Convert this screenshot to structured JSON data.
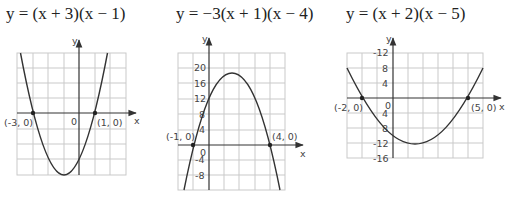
{
  "graphs": [
    {
      "title": "y = (x + 3)(x − 1)",
      "axis_x": "x",
      "axis_y": "y",
      "origin_label": "0",
      "root_labels": [
        "(-3, 0)",
        "(1, 0)"
      ],
      "y_ticks": []
    },
    {
      "title": "y = −3(x + 1)(x − 4)",
      "axis_x": "x",
      "axis_y": "y",
      "origin_label": "0",
      "root_labels": [
        "(-1, 0)",
        "(4, 0)"
      ],
      "y_ticks": [
        "20",
        "16",
        "12",
        "8",
        "4",
        "-4",
        "-8"
      ]
    },
    {
      "title": "y = (x + 2)(x − 5)",
      "axis_x": "x",
      "axis_y": "y",
      "origin_label": "0",
      "root_labels": [
        "(-2, 0)",
        "(5, 0)"
      ],
      "y_ticks": [
        "-12",
        "8",
        "4",
        "4",
        "8",
        "-12",
        "-16"
      ]
    }
  ],
  "chart_data": [
    {
      "type": "line",
      "title": "y = (x + 3)(x − 1)",
      "xlabel": "x",
      "ylabel": "y",
      "xlim": [
        -4,
        3
      ],
      "ylim": [
        -4,
        4
      ],
      "grid": true,
      "series": [
        {
          "name": "y = (x + 3)(x − 1)",
          "x": [
            -3.3,
            -3,
            -2,
            -1,
            0,
            1,
            2,
            2.3
          ],
          "y": [
            1.39,
            0,
            -3,
            -4,
            -3,
            0,
            5,
            4.29
          ]
        }
      ],
      "annotations": [
        {
          "label": "(-3, 0)",
          "x": -3,
          "y": 0
        },
        {
          "label": "(1, 0)",
          "x": 1,
          "y": 0
        }
      ],
      "vertex": [
        -1,
        -4
      ]
    },
    {
      "type": "line",
      "title": "y = −3(x + 1)(x − 4)",
      "xlabel": "x",
      "ylabel": "y",
      "xlim": [
        -2,
        5
      ],
      "ylim": [
        -12,
        24
      ],
      "y_ticks": [
        20,
        16,
        12,
        8,
        4,
        0,
        -4,
        -8
      ],
      "grid": true,
      "series": [
        {
          "name": "y = −3(x + 1)(x − 4)",
          "x": [
            -1.6,
            -1,
            0,
            1,
            1.5,
            2,
            3,
            4,
            4.6
          ],
          "y": [
            -11.5,
            0,
            12,
            18,
            18.75,
            18,
            12,
            0,
            -11.5
          ]
        }
      ],
      "annotations": [
        {
          "label": "(-1, 0)",
          "x": -1,
          "y": 0
        },
        {
          "label": "(4, 0)",
          "x": 4,
          "y": 0
        }
      ],
      "vertex": [
        1.5,
        18.75
      ]
    },
    {
      "type": "line",
      "title": "y = (x + 2)(x − 5)",
      "xlabel": "x",
      "ylabel": "y",
      "xlim": [
        -3,
        6
      ],
      "ylim": [
        -16,
        12
      ],
      "y_ticks": [
        12,
        8,
        4,
        0,
        -4,
        -8,
        -12,
        -16
      ],
      "grid": true,
      "series": [
        {
          "name": "y = (x + 2)(x − 5)",
          "x": [
            -3,
            -2,
            -1,
            0,
            1,
            1.5,
            2,
            3,
            4,
            5,
            6
          ],
          "y": [
            8,
            0,
            -6,
            -10,
            -12,
            -12.25,
            -12,
            -10,
            -6,
            0,
            8
          ]
        }
      ],
      "annotations": [
        {
          "label": "(-2, 0)",
          "x": -2,
          "y": 0
        },
        {
          "label": "(5, 0)",
          "x": 5,
          "y": 0
        }
      ],
      "vertex": [
        1.5,
        -12.25
      ]
    }
  ]
}
